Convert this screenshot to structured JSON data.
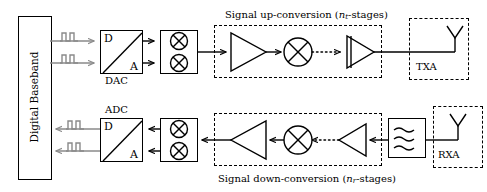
{
  "figure": {
    "type": "block-diagram",
    "colors": {
      "line": "#000000",
      "pulse": "#8a8a8a",
      "background": "#ffffff"
    }
  },
  "baseband": {
    "label": "Digital Baseband"
  },
  "transmit_chain": {
    "region_label_prefix": "Signal up-conversion (",
    "region_label_var": "n",
    "region_label_sub": "t",
    "region_label_suffix": "-stages)",
    "converter": {
      "top_symbol": "D",
      "bottom_symbol": "A",
      "label": "DAC"
    },
    "mixer_symbol": "circled-x",
    "mixer_count": 2,
    "antenna": {
      "label": "TXA"
    }
  },
  "receive_chain": {
    "region_label_prefix": "Signal down-conversion (",
    "region_label_var": "n",
    "region_label_sub": "r",
    "region_label_suffix": "-stages)",
    "converter": {
      "top_symbol": "D",
      "bottom_symbol": "A",
      "label": "ADC"
    },
    "mixer_symbol": "circled-x",
    "mixer_count": 2,
    "filter_symbol": "bandpass-wavy",
    "antenna": {
      "label": "RXA"
    }
  }
}
